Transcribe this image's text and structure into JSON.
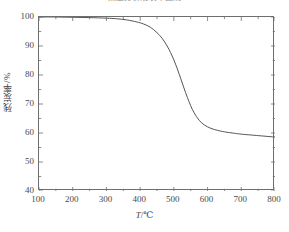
{
  "chart_data": {
    "type": "line",
    "title": "热重分析残炭率曲线",
    "xlabel": "T/℃",
    "ylabel": "残炭率/%",
    "xlim": [
      100,
      800
    ],
    "ylim": [
      40,
      100
    ],
    "x_ticks": [
      100,
      200,
      300,
      400,
      500,
      600,
      700,
      800
    ],
    "y_ticks": [
      40,
      50,
      60,
      70,
      80,
      90,
      100
    ],
    "x_minor_per_interval": 1,
    "y_minor_per_interval": 1,
    "grid": false,
    "legend": null,
    "line_color": "#555555",
    "frame_color": "#6e6e6e",
    "background": "#ffffff",
    "series": [
      {
        "name": "残炭率",
        "x": [
          100,
          150,
          200,
          250,
          300,
          330,
          360,
          390,
          410,
          430,
          450,
          465,
          480,
          490,
          500,
          510,
          520,
          530,
          540,
          550,
          560,
          575,
          590,
          610,
          630,
          650,
          680,
          700,
          730,
          760,
          800
        ],
        "values": [
          100.0,
          100.0,
          99.9,
          99.8,
          99.6,
          99.4,
          99.0,
          98.3,
          97.6,
          96.5,
          94.6,
          92.7,
          90.0,
          87.8,
          85.2,
          82.2,
          78.9,
          75.5,
          72.3,
          69.4,
          67.0,
          64.4,
          62.8,
          61.6,
          60.9,
          60.4,
          59.9,
          59.6,
          59.3,
          59.0,
          58.6
        ]
      }
    ]
  },
  "axes": {
    "y_tick_labels": [
      "100",
      "90",
      "80",
      "70",
      "60",
      "50",
      "40"
    ],
    "x_tick_labels": [
      "100",
      "200",
      "300",
      "400",
      "500",
      "600",
      "700",
      "800"
    ],
    "x_title_prefix": "T",
    "x_title_suffix": "/℃",
    "y_title": "残炭率/%"
  }
}
